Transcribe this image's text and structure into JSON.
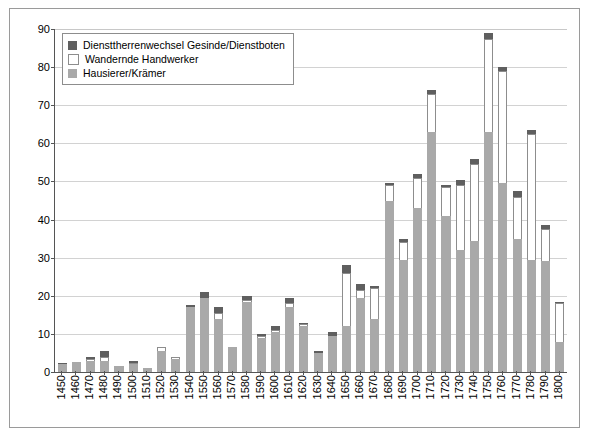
{
  "chart_data": {
    "type": "bar",
    "title": "",
    "subtitle": "",
    "xlabel": "",
    "ylabel": "",
    "ylim": [
      0,
      90
    ],
    "ytick_step": 10,
    "yticks": [
      0,
      10,
      20,
      30,
      40,
      50,
      60,
      70,
      80,
      90
    ],
    "grid": true,
    "stacked": true,
    "legend_position": "top-left",
    "categories": [
      "1450",
      "1460",
      "1470",
      "1480",
      "1490",
      "1500",
      "1510",
      "1520",
      "1530",
      "1540",
      "1550",
      "1560",
      "1570",
      "1580",
      "1590",
      "1600",
      "1610",
      "1620",
      "1630",
      "1640",
      "1650",
      "1660",
      "1670",
      "1680",
      "1690",
      "1700",
      "1710",
      "1720",
      "1730",
      "1740",
      "1750",
      "1760",
      "1770",
      "1780",
      "1790",
      "1800"
    ],
    "series": [
      {
        "name": "Hausierer/Krämer",
        "color": "#a9a9a9",
        "values": [
          2,
          2.5,
          3,
          3,
          1.5,
          2,
          1,
          5.5,
          3.5,
          17,
          19.5,
          14,
          6.5,
          18.5,
          9,
          10.5,
          17,
          12,
          5,
          9.5,
          12,
          19.5,
          14,
          45,
          29.5,
          43,
          63,
          41,
          32,
          34.5,
          63,
          49.5,
          35,
          29.5,
          29,
          8
        ]
      },
      {
        "name": "Wandernde Handwerker",
        "color": "#ffffff",
        "values": [
          0,
          0,
          0.5,
          1,
          0,
          0.5,
          0,
          1,
          0.5,
          0,
          0,
          1.5,
          0,
          0.5,
          0.5,
          0.5,
          1,
          0.5,
          0,
          0,
          14,
          2,
          8,
          4,
          4.5,
          8,
          10,
          7.5,
          17,
          20,
          24.5,
          29.5,
          11,
          33,
          8.5,
          10
        ]
      },
      {
        "name": "Diensttherrenwechsel Gesinde/Dienstboten",
        "color": "#5f5f5f",
        "values": [
          0.5,
          0,
          0.5,
          1.5,
          0,
          0.5,
          0,
          0,
          0,
          0.5,
          1.5,
          1.5,
          0,
          1,
          0.5,
          1,
          1.5,
          0.5,
          0.5,
          1,
          2,
          1.5,
          0.5,
          0.5,
          1,
          1,
          1,
          0.5,
          1.5,
          1.5,
          1.5,
          1,
          1.5,
          1,
          1,
          0.5
        ]
      }
    ],
    "totals": [
      2.5,
      2.5,
      4,
      5.5,
      1.5,
      3,
      1,
      6.5,
      4,
      17.5,
      21,
      17,
      6.5,
      20,
      10,
      12,
      19.5,
      13,
      5.5,
      10.5,
      28,
      23,
      22.5,
      49.5,
      35,
      52,
      74,
      49,
      50.5,
      56,
      89,
      80,
      47.5,
      63.5,
      38.5,
      18.5
    ]
  },
  "legend": {
    "items": [
      {
        "label": "Diensttherrenwechsel Gesinde/Dienstboten",
        "swatch": "dienst"
      },
      {
        "label": "Wandernde Handwerker",
        "swatch": "wandernde"
      },
      {
        "label": "Hausierer/Krämer",
        "swatch": "hausierer"
      }
    ]
  },
  "colors": {
    "dienst": "#5f5f5f",
    "wandernde": "#ffffff",
    "hausierer": "#a9a9a9",
    "axis": "#555555",
    "grid": "#d2d2d2",
    "frame": "#9a9a9a",
    "background": "#ffffff"
  }
}
